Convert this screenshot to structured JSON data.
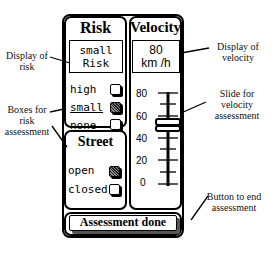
{
  "risk": {
    "title": "Risk",
    "display_line1": "small",
    "display_line2": "Risk",
    "options": [
      {
        "label": "high",
        "checked": false
      },
      {
        "label": "small",
        "checked": true
      },
      {
        "label": "none",
        "checked": false
      }
    ]
  },
  "velocity": {
    "title": "Velocity",
    "display_value": "80",
    "display_unit": "km /h",
    "scale": [
      "80",
      "60",
      "40",
      "20",
      "0"
    ],
    "slider_value": 55
  },
  "street": {
    "title": "Street",
    "options": [
      {
        "label": "open",
        "checked": true
      },
      {
        "label": "closed",
        "checked": false
      }
    ]
  },
  "button": {
    "label": "Assessment done"
  },
  "annotations": {
    "display_risk": "Display of risk",
    "boxes_risk": "Boxes for risk assessment",
    "display_velocity": "Display of velocity",
    "slide_velocity": "Slide for velocity assessment",
    "button_end": "Button to end assessment"
  }
}
